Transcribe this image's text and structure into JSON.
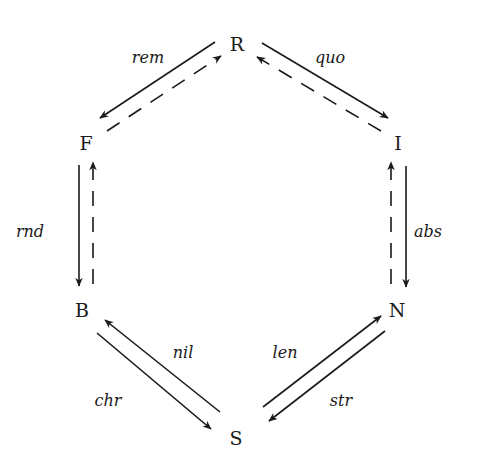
{
  "diagram": {
    "type": "commutative-hexagon",
    "background": "#ffffff",
    "ink_color": "#1a1a1a",
    "nodes": [
      {
        "id": "R",
        "label": "R",
        "x": 237,
        "y": 46
      },
      {
        "id": "I",
        "label": "I",
        "x": 398,
        "y": 145
      },
      {
        "id": "N",
        "label": "N",
        "x": 397,
        "y": 312
      },
      {
        "id": "S",
        "label": "S",
        "x": 236,
        "y": 440
      },
      {
        "id": "B",
        "label": "B",
        "x": 82,
        "y": 312
      },
      {
        "id": "F",
        "label": "F",
        "x": 86,
        "y": 145
      }
    ],
    "edges": [
      {
        "from": "R",
        "to": "F",
        "label": "rem",
        "style": "solid",
        "x1": 215,
        "y1": 42,
        "x2": 100,
        "y2": 118
      },
      {
        "from": "F",
        "to": "R",
        "label": "",
        "style": "dashed",
        "x1": 107,
        "y1": 131,
        "x2": 221,
        "y2": 56
      },
      {
        "from": "R",
        "to": "I",
        "label": "quo",
        "style": "solid",
        "x1": 262,
        "y1": 43,
        "x2": 388,
        "y2": 118
      },
      {
        "from": "I",
        "to": "R",
        "label": "",
        "style": "dashed",
        "x1": 381,
        "y1": 131,
        "x2": 257,
        "y2": 57
      },
      {
        "from": "F",
        "to": "B",
        "label": "rnd",
        "style": "solid",
        "x1": 79,
        "y1": 165,
        "x2": 79,
        "y2": 286
      },
      {
        "from": "B",
        "to": "F",
        "label": "",
        "style": "dashed",
        "x1": 93,
        "y1": 284,
        "x2": 93,
        "y2": 162
      },
      {
        "from": "I",
        "to": "N",
        "label": "abs",
        "style": "solid",
        "x1": 406,
        "y1": 166,
        "x2": 406,
        "y2": 287
      },
      {
        "from": "N",
        "to": "I",
        "label": "",
        "style": "dashed",
        "x1": 391,
        "y1": 284,
        "x2": 391,
        "y2": 162
      },
      {
        "from": "B",
        "to": "S",
        "label": "chr",
        "style": "solid",
        "x1": 97,
        "y1": 333,
        "x2": 211,
        "y2": 429
      },
      {
        "from": "S",
        "to": "B",
        "label": "nil",
        "style": "solid",
        "x1": 220,
        "y1": 412,
        "x2": 105,
        "y2": 320
      },
      {
        "from": "S",
        "to": "N",
        "label": "len",
        "style": "solid",
        "x1": 263,
        "y1": 407,
        "x2": 381,
        "y2": 316
      },
      {
        "from": "N",
        "to": "S",
        "label": "str",
        "style": "solid",
        "x1": 385,
        "y1": 331,
        "x2": 269,
        "y2": 421
      }
    ],
    "edge_labels": [
      {
        "text": "rem",
        "x": 148,
        "y": 58
      },
      {
        "text": "quo",
        "x": 330,
        "y": 58
      },
      {
        "text": "rnd",
        "x": 30,
        "y": 232
      },
      {
        "text": "abs",
        "x": 428,
        "y": 232
      },
      {
        "text": "nil",
        "x": 183,
        "y": 353
      },
      {
        "text": "len",
        "x": 285,
        "y": 353
      },
      {
        "text": "chr",
        "x": 108,
        "y": 401
      },
      {
        "text": "str",
        "x": 341,
        "y": 401
      }
    ]
  }
}
